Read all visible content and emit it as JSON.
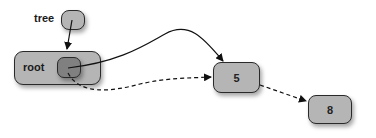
{
  "diagram": {
    "type": "linked-structure",
    "labels": {
      "tree": "tree",
      "root": "root"
    },
    "nodes": [
      {
        "id": "node-5",
        "value": "5"
      },
      {
        "id": "node-8",
        "value": "8"
      }
    ],
    "edges": [
      {
        "from": "tree",
        "to": "root",
        "style": "solid"
      },
      {
        "from": "root",
        "to": "node-5",
        "style": "solid"
      },
      {
        "from": "root",
        "to": "node-5",
        "style": "dashed"
      },
      {
        "from": "node-5",
        "to": "node-8",
        "style": "dashed"
      }
    ],
    "colors": {
      "box_fill": "#b5b5b5",
      "inner_fill": "#808080",
      "stroke": "#2a2a2a"
    }
  }
}
